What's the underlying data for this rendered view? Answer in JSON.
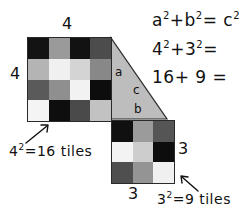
{
  "figure": {
    "background_color": "#ffffff",
    "ink_color": "#111111",
    "outline_color": "#2a2a2a"
  },
  "equations": {
    "line1_base": "a",
    "line1_exp1": "2",
    "line1_plus": "+b",
    "line1_exp2": "2",
    "line1_eq": "= c",
    "line1_exp3": "2",
    "line1_full": "a2+b2 = c2",
    "line2_base": "4",
    "line2_exp1": "2",
    "line2_plus": "+3",
    "line2_exp2": "2",
    "line2_eq": "=",
    "line2_full": "42+32 =",
    "line3_full": "16+ 9 ="
  },
  "square_a": {
    "side_label_top": "4",
    "side_label_left": "4",
    "note_base": "4",
    "note_exp": "2",
    "note_rest": "=16 tiles",
    "rows": 4,
    "cols": 4,
    "cells": [
      [
        "#131313",
        "#9a9a9a",
        "#121212",
        "#4c4c4c"
      ],
      [
        "#b4b4b4",
        "#f0f0f0",
        "#d4d4d4",
        "#888888"
      ],
      [
        "#5a5a5a",
        "#8f8f8f",
        "#f2f2f2",
        "#0d0d0d"
      ],
      [
        "#f4f4f4",
        "#0e0e0e",
        "#4a4a4a",
        "#c2c2c2"
      ]
    ]
  },
  "square_b": {
    "side_label_right": "3",
    "side_label_bottom": "3",
    "note_base": "3",
    "note_exp": "2",
    "note_rest": "=9 tiles",
    "rows": 3,
    "cols": 3,
    "cells": [
      [
        "#101010",
        "#9b9b9b",
        "#555555"
      ],
      [
        "#f3f3f3",
        "#cdcdcd",
        "#0d0d0d"
      ],
      [
        "#4f4f4f",
        "#949494",
        "#f0f0f0"
      ]
    ]
  },
  "triangle": {
    "fill_color": "#bdbdbd",
    "leg_a_label": "a",
    "hyp_c_label": "c",
    "leg_b_label": "b"
  },
  "arrows": {
    "left_arrow_name": "arrow-to-4x4-square",
    "right_arrow_name": "arrow-to-3x3-square"
  }
}
